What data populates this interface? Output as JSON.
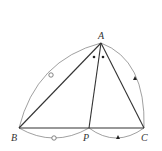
{
  "diagram": {
    "type": "geometry-figure",
    "points": {
      "A": {
        "label": "A",
        "x": 101,
        "y": 43
      },
      "B": {
        "label": "B",
        "x": 19,
        "y": 128
      },
      "P": {
        "label": "P",
        "x": 89,
        "y": 128
      },
      "C": {
        "label": "C",
        "x": 144,
        "y": 128
      }
    },
    "segments": [
      "AB",
      "AC",
      "AP",
      "BC"
    ],
    "arcs": [
      {
        "from": "B",
        "to": "A",
        "marker": "open-circle"
      },
      {
        "from": "A",
        "to": "C",
        "marker": "filled-triangle"
      },
      {
        "from": "B",
        "to": "P",
        "marker": "open-circle"
      },
      {
        "from": "P",
        "to": "C",
        "marker": "filled-triangle"
      }
    ],
    "angle_marks": [
      {
        "angle": "BAP",
        "marker": "dot"
      },
      {
        "angle": "PAC",
        "marker": "dot"
      }
    ],
    "colors": {
      "line": "#333333",
      "arc": "#777777",
      "background": "#ffffff"
    }
  }
}
